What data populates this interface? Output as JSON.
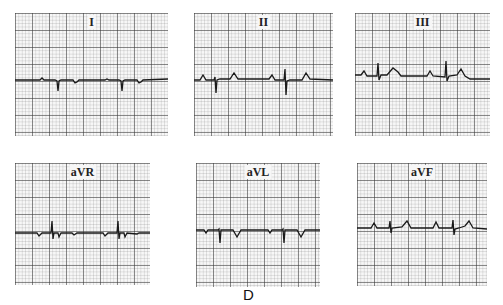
{
  "figure": {
    "caption": "D",
    "grid_color": "#555555",
    "trace_color": "#1a1a1a"
  },
  "leads": [
    {
      "id": "I",
      "label": "I"
    },
    {
      "id": "II",
      "label": "II"
    },
    {
      "id": "III",
      "label": "III"
    },
    {
      "id": "aVR",
      "label": "aVR"
    },
    {
      "id": "aVL",
      "label": "aVL"
    },
    {
      "id": "aVF",
      "label": "aVF"
    }
  ]
}
